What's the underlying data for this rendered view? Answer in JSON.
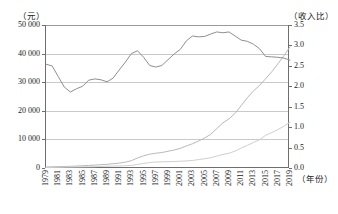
{
  "chart_data": {
    "type": "line",
    "title": "",
    "xlabel": "（年份）",
    "ylabel_left": "（元）",
    "ylabel_right": "（收入比）",
    "x": [
      1979,
      1980,
      1981,
      1982,
      1983,
      1984,
      1985,
      1986,
      1987,
      1988,
      1989,
      1990,
      1991,
      1992,
      1993,
      1994,
      1995,
      1996,
      1997,
      1998,
      1999,
      2000,
      2001,
      2002,
      2003,
      2004,
      2005,
      2006,
      2007,
      2008,
      2009,
      2010,
      2011,
      2012,
      2013,
      2014,
      2015,
      2016,
      2017,
      2018,
      2019
    ],
    "xticks": [
      "1979",
      "1981",
      "1983",
      "1985",
      "1987",
      "1989",
      "1991",
      "1993",
      "1995",
      "1997",
      "1999",
      "2001",
      "2003",
      "2005",
      "2007",
      "2009",
      "2011",
      "2013",
      "2015",
      "2017",
      "2019"
    ],
    "yticks_left": [
      "0",
      "10 000",
      "20 000",
      "30 000",
      "40 000",
      "50 000"
    ],
    "yticks_right": [
      "0.0",
      "0.5",
      "1.0",
      "1.5",
      "2.0",
      "2.5",
      "3.0",
      "3.5"
    ],
    "ylim_left": [
      0,
      50000
    ],
    "ylim_right": [
      0.0,
      3.5
    ],
    "grid": true,
    "legend_position": "none",
    "series": [
      {
        "name": "城镇居民收入",
        "axis": "left",
        "color": "#b9b9b9",
        "values": [
          343,
          405,
          500,
          535,
          575,
          690,
          790,
          910,
          1010,
          1180,
          1270,
          1510,
          1700,
          2030,
          2580,
          3500,
          4280,
          4840,
          5160,
          5420,
          5850,
          6280,
          6860,
          7700,
          8470,
          9420,
          10490,
          11760,
          13790,
          15780,
          17175,
          19109,
          21810,
          24565,
          26955,
          28844,
          31195,
          33616,
          36396,
          39251,
          42359
        ]
      },
      {
        "name": "农村居民收入",
        "axis": "left",
        "color": "#cfcfcf",
        "values": [
          160,
          191,
          223,
          270,
          310,
          355,
          398,
          424,
          463,
          545,
          602,
          686,
          709,
          784,
          922,
          1221,
          1578,
          1926,
          2090,
          2162,
          2210,
          2253,
          2366,
          2476,
          2622,
          2936,
          3255,
          3587,
          4140,
          4761,
          5153,
          5919,
          6977,
          7917,
          8896,
          9892,
          11422,
          12363,
          13432,
          14617,
          16021
        ]
      },
      {
        "name": "城乡收入比",
        "axis": "right",
        "color": "#8f8f8f",
        "values": [
          2.54,
          2.5,
          2.24,
          1.98,
          1.86,
          1.94,
          2.0,
          2.15,
          2.18,
          2.16,
          2.11,
          2.2,
          2.4,
          2.59,
          2.8,
          2.87,
          2.71,
          2.51,
          2.47,
          2.51,
          2.65,
          2.79,
          2.9,
          3.11,
          3.23,
          3.21,
          3.22,
          3.28,
          3.33,
          3.31,
          3.33,
          3.23,
          3.13,
          3.1,
          3.03,
          2.92,
          2.73,
          2.72,
          2.71,
          2.69,
          2.64
        ]
      }
    ]
  }
}
